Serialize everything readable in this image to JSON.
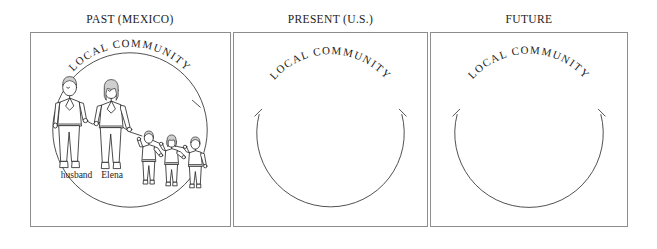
{
  "figure": {
    "background_color": "#ffffff",
    "ink_color": "#1b1b1b",
    "border_color": "#8d8d8d",
    "columns": [
      {
        "id": "past",
        "header": "PAST (MEXICO)",
        "circle_label": "LOCAL COMMUNITY",
        "circle_closed": true,
        "people": [
          {
            "label": "husband",
            "role": "adult",
            "order": 1
          },
          {
            "label": "Elena",
            "role": "adult",
            "order": 2
          },
          {
            "label": "",
            "role": "child",
            "order": 3
          },
          {
            "label": "",
            "role": "child",
            "order": 4
          },
          {
            "label": "",
            "role": "child",
            "order": 5
          }
        ],
        "person_labels": [
          "husband",
          "Elena"
        ]
      },
      {
        "id": "present",
        "header": "PRESENT (U.S.)",
        "circle_label": "LOCAL COMMUNITY",
        "circle_closed": false,
        "people": [],
        "person_labels": []
      },
      {
        "id": "future",
        "header": "FUTURE",
        "circle_label": "LOCAL COMMUNITY",
        "circle_closed": false,
        "people": [],
        "person_labels": []
      }
    ]
  }
}
